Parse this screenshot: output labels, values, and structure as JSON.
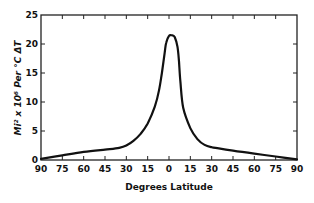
{
  "chart_data": {
    "type": "line",
    "title": "",
    "xlabel": "Degrees Latitude",
    "ylabel": "Mi² x 10⁶ Per °C ΔT",
    "x_tick_labels": [
      "90",
      "75",
      "60",
      "45",
      "30",
      "15",
      "0",
      "15",
      "30",
      "45",
      "60",
      "75",
      "90"
    ],
    "y_tick_labels": [
      "0",
      "5",
      "10",
      "15",
      "20",
      "25"
    ],
    "ylim": [
      0,
      25
    ],
    "xlim": [
      -90,
      90
    ],
    "grid": false,
    "legend": null,
    "series": [
      {
        "name": "area per °C ΔT",
        "x": [
          -90,
          -75,
          -60,
          -45,
          -35,
          -30,
          -25,
          -20,
          -15,
          -10,
          -7,
          -5,
          -3,
          -2,
          0,
          2,
          4,
          6,
          7,
          8,
          10,
          15,
          20,
          25,
          30,
          35,
          45,
          60,
          75,
          90
        ],
        "values": [
          0.2,
          0.8,
          1.4,
          1.8,
          2.1,
          2.5,
          3.3,
          4.5,
          6.3,
          9.2,
          12.0,
          15.0,
          18.5,
          20.2,
          21.4,
          21.5,
          21.2,
          19.5,
          17.0,
          13.5,
          9.0,
          5.5,
          3.6,
          2.6,
          2.2,
          2.0,
          1.6,
          1.1,
          0.6,
          0.1
        ]
      }
    ]
  }
}
